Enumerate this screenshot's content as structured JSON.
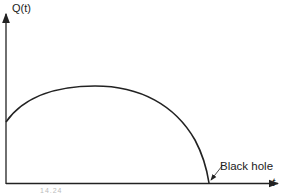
{
  "diagram": {
    "y_axis_label": "Q(t)",
    "x_axis_label": "t",
    "annotation": "Black hole",
    "figure_number": "14.24",
    "curve": "Q(t) rises from a nonzero initial value to a maximum, then falls steeply to zero at the point labeled Black hole",
    "colors": {
      "line": "#222222",
      "background": "#ffffff"
    }
  }
}
